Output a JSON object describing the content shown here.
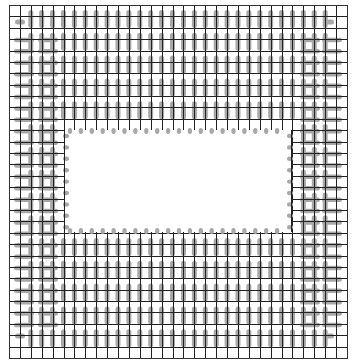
{
  "diagram": {
    "title": "",
    "type": "pad-layout-grid",
    "canvas": {
      "width": 354,
      "height": 364,
      "background": "#ffffff"
    },
    "grid": {
      "left": 9,
      "top": 5,
      "right": 347,
      "bottom": 358,
      "columns": 31,
      "rows": 31,
      "line_color": "#222222"
    },
    "cutout": {
      "left": 64,
      "top": 130,
      "right": 292,
      "bottom": 232,
      "fill": "#ffffff"
    },
    "pads": {
      "color": "#a8a8a8",
      "vertical": {
        "x_start_col": 2,
        "x_end_col": 29,
        "width": 5,
        "length": 18,
        "y_start": 10,
        "y_end": 352,
        "pitch": 22.8
      },
      "left_horizontal": {
        "columns_x": [
          [
            14,
            34
          ],
          [
            38,
            58
          ]
        ],
        "height": 4.5,
        "y_start": 40,
        "y_end": 332,
        "pitch": 11.4
      },
      "right_horizontal": {
        "columns_x": [
          [
            300,
            320
          ],
          [
            322,
            342
          ]
        ],
        "height": 4.5,
        "y_start": 40,
        "y_end": 332,
        "pitch": 11.4
      },
      "cutout_border_dots": {
        "size": 5,
        "pitch_x": 10.9,
        "pitch_y": 11.4
      }
    }
  }
}
